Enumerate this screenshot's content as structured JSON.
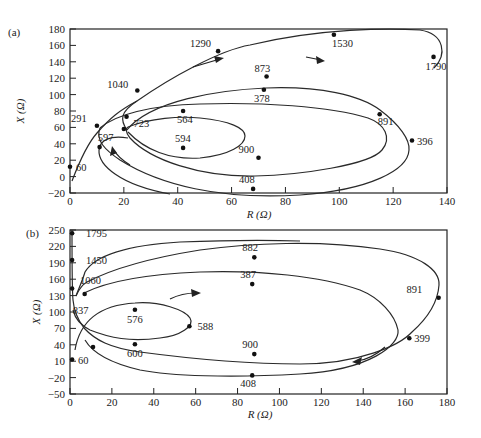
{
  "chart_data": [
    {
      "panel": "(a)",
      "type": "line",
      "title": "",
      "xlabel": "R (Ω)",
      "ylabel": "X (Ω)",
      "xlim": [
        0,
        140
      ],
      "ylim": [
        -20,
        180
      ],
      "xticks": [
        0,
        20,
        40,
        60,
        80,
        100,
        120,
        140
      ],
      "yticks": [
        -20,
        0,
        20,
        40,
        60,
        80,
        100,
        120,
        140,
        160,
        180
      ],
      "grid": false,
      "points": [
        {
          "label": "60",
          "R": 0,
          "X": 12
        },
        {
          "label": "291",
          "R": 10,
          "X": 62
        },
        {
          "label": "1040",
          "R": 25,
          "X": 105
        },
        {
          "label": "1290",
          "R": 55,
          "X": 153
        },
        {
          "label": "1530",
          "R": 98,
          "X": 173
        },
        {
          "label": "1790",
          "R": 135,
          "X": 146
        },
        {
          "label": "873",
          "R": 73,
          "X": 122
        },
        {
          "label": "378",
          "R": 72,
          "X": 106
        },
        {
          "label": "891",
          "R": 115,
          "X": 76
        },
        {
          "label": "396",
          "R": 127,
          "X": 44
        },
        {
          "label": "900",
          "R": 70,
          "X": 23
        },
        {
          "label": "408",
          "R": 68,
          "X": -15
        },
        {
          "label": "564",
          "R": 42,
          "X": 80
        },
        {
          "label": "594",
          "R": 42,
          "X": 35
        },
        {
          "label": "723",
          "R": 21,
          "X": 73
        },
        {
          "label": "597",
          "R": 20,
          "X": 58
        },
        {
          "label": "",
          "R": 11,
          "X": 36
        }
      ]
    },
    {
      "panel": "(b)",
      "type": "line",
      "title": "",
      "xlabel": "R (Ω)",
      "ylabel": "X (Ω)",
      "xlim": [
        0,
        180
      ],
      "ylim": [
        -50,
        250
      ],
      "xticks": [
        0,
        20,
        40,
        60,
        80,
        100,
        120,
        140,
        160,
        180
      ],
      "yticks": [
        -50,
        -20,
        10,
        40,
        70,
        100,
        130,
        160,
        190,
        220,
        250
      ],
      "grid": false,
      "points": [
        {
          "label": "1795",
          "R": 1,
          "X": 244
        },
        {
          "label": "1450",
          "R": 1,
          "X": 195
        },
        {
          "label": "1060",
          "R": 1,
          "X": 143
        },
        {
          "label": "837",
          "R": 7,
          "X": 133
        },
        {
          "label": "60",
          "R": 1,
          "X": 13
        },
        {
          "label": "576",
          "R": 31,
          "X": 104
        },
        {
          "label": "588",
          "R": 57,
          "X": 74
        },
        {
          "label": "600",
          "R": 31,
          "X": 41
        },
        {
          "label": "882",
          "R": 88,
          "X": 200
        },
        {
          "label": "387",
          "R": 87,
          "X": 151
        },
        {
          "label": "891",
          "R": 176,
          "X": 126
        },
        {
          "label": "399",
          "R": 162,
          "X": 52
        },
        {
          "label": "900",
          "R": 88,
          "X": 23
        },
        {
          "label": "408",
          "R": 87,
          "X": -16
        },
        {
          "label": "",
          "R": 11,
          "X": 36
        }
      ]
    }
  ],
  "panels": {
    "a": {
      "tag": "(a)",
      "xlabel": "R (Ω)",
      "ylabel": "X (Ω)"
    },
    "b": {
      "tag": "(b)",
      "xlabel": "R (Ω)",
      "ylabel": "X (Ω)"
    }
  }
}
